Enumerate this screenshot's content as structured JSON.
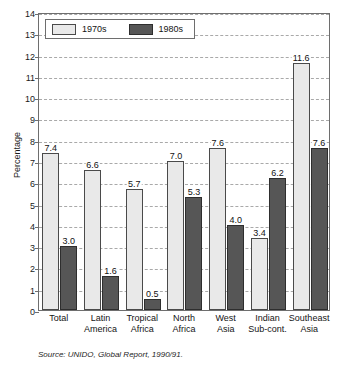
{
  "title_remnant": "",
  "source_note": "Source: UNIDO, Global Report, 1990/91.",
  "legend": {
    "items": [
      {
        "label": "1970s",
        "swatch": "legend-swatch-1970s",
        "color": "#e9e9e9"
      },
      {
        "label": "1980s",
        "swatch": "legend-swatch-1980s",
        "color": "#565656"
      }
    ]
  },
  "chart_data": {
    "type": "bar",
    "title": "",
    "xlabel": "",
    "ylabel": "Percentage",
    "ylim": [
      0,
      14
    ],
    "ytick_step": 1,
    "yticks": [
      14,
      13,
      12,
      11,
      10,
      9,
      8,
      7,
      6,
      5,
      4,
      3,
      2,
      1,
      0
    ],
    "ytick_labels": [
      "14",
      "13",
      "12",
      "11",
      "10",
      "9",
      "8",
      "7",
      "6",
      "5",
      "4",
      "3",
      "2",
      "1",
      "0"
    ],
    "grid": true,
    "grid_style": "dashed",
    "legend_position": "top-left",
    "categories": [
      "Total",
      "Latin America",
      "Tropical Africa",
      "North Africa",
      "West Asia",
      "Indian Sub-cont.",
      "Southeast Asia"
    ],
    "category_lines": [
      [
        "Total"
      ],
      [
        "Latin",
        "America"
      ],
      [
        "Tropical",
        "Africa"
      ],
      [
        "North",
        "Africa"
      ],
      [
        "West",
        "Asia"
      ],
      [
        "Indian",
        "Sub-cont."
      ],
      [
        "Southeast",
        "Asia"
      ]
    ],
    "series": [
      {
        "name": "1970s",
        "color": "#e9e9e9",
        "values": [
          7.4,
          6.6,
          5.7,
          7.0,
          7.6,
          3.4,
          11.6
        ],
        "labels": [
          "7.4",
          "6.6",
          "5.7",
          "7.0",
          "7.6",
          "3.4",
          "11.6"
        ]
      },
      {
        "name": "1980s",
        "color": "#565656",
        "values": [
          3.0,
          1.6,
          0.5,
          5.3,
          4.0,
          6.2,
          7.6
        ],
        "labels": [
          "3.0",
          "1.6",
          "0.5",
          "5.3",
          "4.0",
          "6.2",
          "7.6"
        ]
      }
    ]
  }
}
